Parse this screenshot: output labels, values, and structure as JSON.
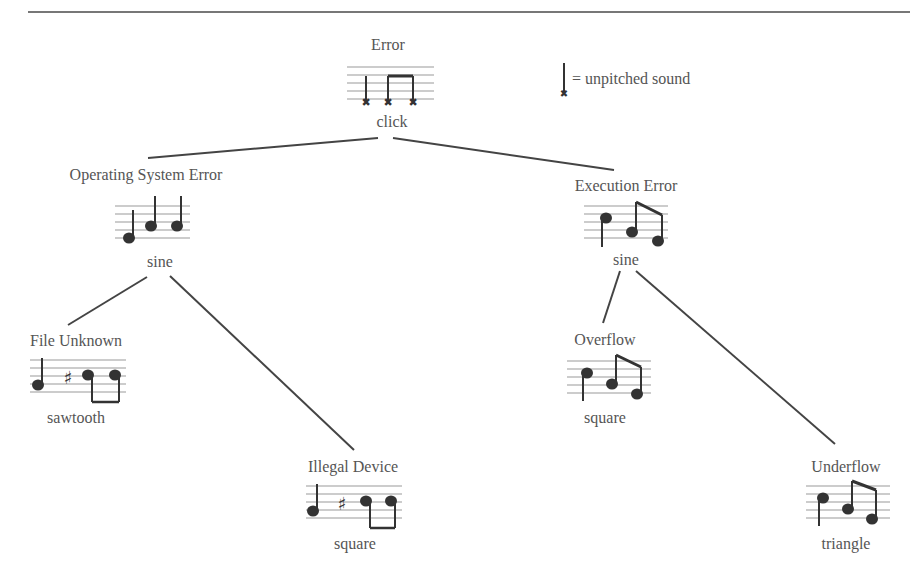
{
  "legend": {
    "text": "= unpitched sound",
    "icon": "unpitched-note-icon"
  },
  "colors": {
    "line": "#444444",
    "staff": "#999999",
    "text": "#555555"
  },
  "nodes": [
    {
      "id": "error",
      "title": "Error",
      "waveform": "click",
      "notation": "three unpitched notes, last two beamed"
    },
    {
      "id": "os-error",
      "title": "Operating System Error",
      "waveform": "sine",
      "notation": "three ascending quarter notes"
    },
    {
      "id": "exec-error",
      "title": "Execution Error",
      "waveform": "sine",
      "notation": "quarter note + two beamed descending eighth notes"
    },
    {
      "id": "file-unknown",
      "title": "File Unknown",
      "waveform": "sawtooth",
      "notation": "quarter note, sharp, two beamed notes (stems down)"
    },
    {
      "id": "illegal-device",
      "title": "Illegal Device",
      "waveform": "square",
      "notation": "quarter note, sharp, two beamed notes (stems down)"
    },
    {
      "id": "overflow",
      "title": "Overflow",
      "waveform": "square",
      "notation": "quarter note + two beamed descending eighth notes"
    },
    {
      "id": "underflow",
      "title": "Underflow",
      "waveform": "triangle",
      "notation": "quarter note + two beamed descending eighth notes"
    }
  ],
  "edges": [
    [
      "error",
      "os-error"
    ],
    [
      "error",
      "exec-error"
    ],
    [
      "os-error",
      "file-unknown"
    ],
    [
      "os-error",
      "illegal-device"
    ],
    [
      "exec-error",
      "overflow"
    ],
    [
      "exec-error",
      "underflow"
    ]
  ]
}
